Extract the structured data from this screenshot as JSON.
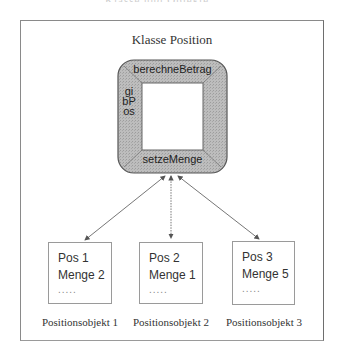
{
  "header": {
    "cut_text": "Klasse und Objekte"
  },
  "frame": {
    "title": "Klasse Position"
  },
  "component": {
    "methods": {
      "top": "berechneBetrag",
      "left": "gibPos",
      "bottom": "setzeMenge"
    },
    "fill_color": "#b4b4b4",
    "border_color": "#555555"
  },
  "objects": [
    {
      "lines": [
        "Pos 1",
        "Menge 2"
      ],
      "dots": ".....",
      "label": "Positionsobjekt 1"
    },
    {
      "lines": [
        "Pos 2",
        "Menge 1"
      ],
      "dots": ".....",
      "label": "Positionsobjekt 2"
    },
    {
      "lines": [
        "Pos 3",
        "Menge 5"
      ],
      "dots": ".....",
      "label": "Positionsobjekt 3"
    }
  ]
}
